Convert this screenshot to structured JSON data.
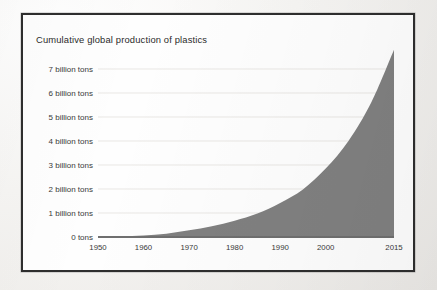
{
  "figure": {
    "title": "Cumulative global production of plastics",
    "frame_color": "#2e2e2e",
    "page_background": "#f2f1ef",
    "plot_background": "#fefefe"
  },
  "chart_data": {
    "type": "area",
    "title": "Cumulative global production of plastics",
    "xlabel": "",
    "ylabel": "",
    "grid": true,
    "legend": false,
    "fill_color": "#808080",
    "gridline_color": "#e9e7e4",
    "axis_color": "#6f6f6f",
    "xlim": [
      1950,
      2015
    ],
    "ylim": [
      0,
      8
    ],
    "y_unit": "billion tons",
    "x_tick_values": [
      1950,
      1960,
      1970,
      1980,
      1990,
      2000,
      2015
    ],
    "x_tick_labels": [
      "1950",
      "1960",
      "1970",
      "1980",
      "1990",
      "2000",
      "2015"
    ],
    "y_tick_values": [
      0,
      1,
      2,
      3,
      4,
      5,
      6,
      7
    ],
    "y_tick_labels": [
      "0 tons",
      "1 billion tons",
      "2 billion tons",
      "3 billion tons",
      "4 billion tons",
      "5 billion tons",
      "6 billion tons",
      "7 billion tons"
    ],
    "x": [
      1950,
      1955,
      1960,
      1965,
      1970,
      1975,
      1980,
      1985,
      1990,
      1995,
      2000,
      2005,
      2010,
      2015
    ],
    "values": [
      0.0,
      0.02,
      0.06,
      0.14,
      0.28,
      0.45,
      0.68,
      0.98,
      1.42,
      1.98,
      2.85,
      4.0,
      5.6,
      7.8
    ],
    "series": [
      {
        "name": "Cumulative global plastic production",
        "values": [
          0.0,
          0.02,
          0.06,
          0.14,
          0.28,
          0.45,
          0.68,
          0.98,
          1.42,
          1.98,
          2.85,
          4.0,
          5.6,
          7.8
        ]
      }
    ]
  }
}
